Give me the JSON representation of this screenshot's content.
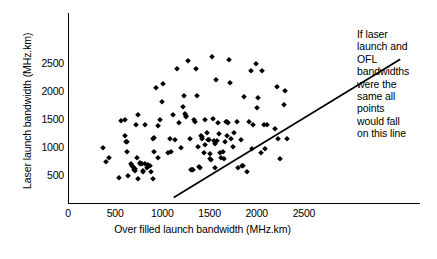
{
  "chart_data": {
    "type": "scatter",
    "title": "",
    "xlabel": "Over filled launch bandwidth (MHz.km)",
    "ylabel": "Laser launch bandwidth (MHz.km)",
    "xlim": [
      0,
      3730
    ],
    "ylim": [
      0,
      3395
    ],
    "xticks": [
      0,
      500,
      1000,
      1500,
      2000,
      2500
    ],
    "xticklabels": [
      "0",
      "500",
      "1000",
      "1500",
      "2000",
      "2500"
    ],
    "yticks": [
      500,
      1000,
      1500,
      2000,
      2500
    ],
    "yticklabels": [
      "500",
      "1000",
      "1500",
      "2000",
      "2500"
    ],
    "grid": false,
    "legend": null,
    "marker": "diamond",
    "marker_color": "#000000",
    "series": [
      {
        "name": "Measured fibres",
        "points": [
          [
            370,
            975
          ],
          [
            400,
            740
          ],
          [
            430,
            800
          ],
          [
            540,
            440
          ],
          [
            560,
            1460
          ],
          [
            600,
            1485
          ],
          [
            600,
            1205
          ],
          [
            615,
            1085
          ],
          [
            620,
            1090
          ],
          [
            630,
            915
          ],
          [
            640,
            490
          ],
          [
            665,
            700
          ],
          [
            680,
            660
          ],
          [
            690,
            640
          ],
          [
            700,
            590
          ],
          [
            705,
            600
          ],
          [
            710,
            575
          ],
          [
            720,
            1395
          ],
          [
            730,
            800
          ],
          [
            740,
            1570
          ],
          [
            745,
            430
          ],
          [
            760,
            720
          ],
          [
            765,
            700
          ],
          [
            780,
            690
          ],
          [
            790,
            580
          ],
          [
            800,
            545
          ],
          [
            815,
            1395
          ],
          [
            820,
            705
          ],
          [
            840,
            620
          ],
          [
            850,
            680
          ],
          [
            865,
            660
          ],
          [
            880,
            545
          ],
          [
            900,
            430
          ],
          [
            905,
            1150
          ],
          [
            910,
            1160
          ],
          [
            915,
            905
          ],
          [
            930,
            2050
          ],
          [
            950,
            1370
          ],
          [
            955,
            800
          ],
          [
            975,
            1490
          ],
          [
            1000,
            1810
          ],
          [
            1010,
            2120
          ],
          [
            1060,
            900
          ],
          [
            1080,
            1150
          ],
          [
            1090,
            915
          ],
          [
            1110,
            1570
          ],
          [
            1130,
            1120
          ],
          [
            1150,
            2400
          ],
          [
            1180,
            1430
          ],
          [
            1200,
            990
          ],
          [
            1215,
            1720
          ],
          [
            1230,
            1920
          ],
          [
            1245,
            1590
          ],
          [
            1250,
            1560
          ],
          [
            1255,
            1530
          ],
          [
            1270,
            2530
          ],
          [
            1290,
            1150
          ],
          [
            1300,
            585
          ],
          [
            1310,
            590
          ],
          [
            1320,
            595
          ],
          [
            1330,
            1490
          ],
          [
            1345,
            1450
          ],
          [
            1355,
            2400
          ],
          [
            1370,
            1920
          ],
          [
            1375,
            995
          ],
          [
            1390,
            640
          ],
          [
            1400,
            630
          ],
          [
            1410,
            1200
          ],
          [
            1420,
            1175
          ],
          [
            1425,
            1150
          ],
          [
            1440,
            895
          ],
          [
            1450,
            1490
          ],
          [
            1455,
            1030
          ],
          [
            1470,
            1255
          ],
          [
            1480,
            1130
          ],
          [
            1490,
            1120
          ],
          [
            1500,
            870
          ],
          [
            1510,
            790
          ],
          [
            1520,
            770
          ],
          [
            1530,
            2605
          ],
          [
            1540,
            1495
          ],
          [
            1545,
            1100
          ],
          [
            1555,
            1060
          ],
          [
            1560,
            620
          ],
          [
            1570,
            2200
          ],
          [
            1580,
            1105
          ],
          [
            1590,
            1425
          ],
          [
            1600,
            1230
          ],
          [
            1610,
            900
          ],
          [
            1625,
            800
          ],
          [
            1640,
            905
          ],
          [
            1650,
            790
          ],
          [
            1660,
            1085
          ],
          [
            1670,
            1445
          ],
          [
            1680,
            1205
          ],
          [
            1690,
            1440
          ],
          [
            1700,
            1435
          ],
          [
            1710,
            2555
          ],
          [
            1720,
            2150
          ],
          [
            1730,
            1150
          ],
          [
            1745,
            1005
          ],
          [
            1760,
            1255
          ],
          [
            1790,
            1450
          ],
          [
            1800,
            620
          ],
          [
            1830,
            1130
          ],
          [
            1840,
            660
          ],
          [
            1850,
            670
          ],
          [
            1870,
            1890
          ],
          [
            1900,
            550
          ],
          [
            1920,
            1450
          ],
          [
            1940,
            2350
          ],
          [
            1950,
            960
          ],
          [
            1960,
            1395
          ],
          [
            1990,
            2490
          ],
          [
            2000,
            1690
          ],
          [
            2010,
            1880
          ],
          [
            2040,
            900
          ],
          [
            2060,
            2350
          ],
          [
            2075,
            1385
          ],
          [
            2090,
            960
          ],
          [
            2110,
            1395
          ],
          [
            2190,
            1320
          ],
          [
            2210,
            2080
          ],
          [
            2230,
            1135
          ],
          [
            2250,
            780
          ],
          [
            2290,
            1760
          ],
          [
            2300,
            2010
          ],
          [
            2320,
            1135
          ]
        ]
      }
    ],
    "reference_line": {
      "label": "y = x (identity line)",
      "x0": 400,
      "y0": 330,
      "x1": 2800,
      "y1": 2800,
      "color": "#000000"
    }
  },
  "annotation": {
    "lines": [
      "If laser",
      "launch and",
      "OFL",
      "bandwidths",
      "were the",
      "same all",
      "points",
      "would fall",
      "on this line"
    ]
  }
}
